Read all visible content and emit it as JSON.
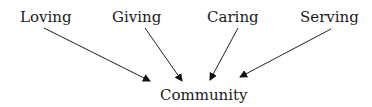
{
  "diagram": {
    "sources": [
      {
        "label": "Loving"
      },
      {
        "label": "Giving"
      },
      {
        "label": "Caring"
      },
      {
        "label": "Serving"
      }
    ],
    "target": {
      "label": "Community"
    },
    "edges": [
      {
        "from": "Loving",
        "to": "Community"
      },
      {
        "from": "Giving",
        "to": "Community"
      },
      {
        "from": "Caring",
        "to": "Community"
      },
      {
        "from": "Serving",
        "to": "Community"
      }
    ]
  }
}
